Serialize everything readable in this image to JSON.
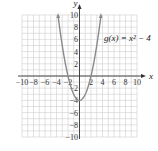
{
  "chart_data": {
    "type": "line",
    "title": "",
    "function_label": "g(x) = x² − 4",
    "xlabel": "x",
    "ylabel": "y",
    "xlim": [
      -10,
      10
    ],
    "ylim": [
      -10,
      10
    ],
    "grid": true,
    "grid_step": 1,
    "x_ticks": [
      -10,
      -8,
      -6,
      -4,
      -2,
      2,
      4,
      6,
      8,
      10
    ],
    "y_ticks": [
      -10,
      -8,
      -6,
      -4,
      -2,
      2,
      4,
      6,
      8,
      10
    ],
    "series": [
      {
        "name": "g(x) = x² − 4",
        "color": "#8a8a8a",
        "x": [
          -3.74,
          -3,
          -2,
          -1,
          0,
          1,
          2,
          3,
          3.74
        ],
        "y": [
          10,
          5,
          0,
          -3,
          -4,
          -3,
          0,
          5,
          10
        ]
      }
    ]
  }
}
